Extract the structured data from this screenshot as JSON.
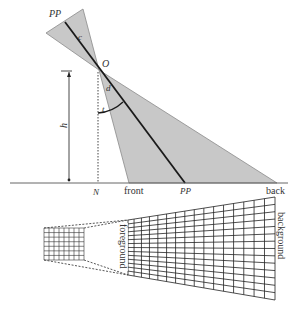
{
  "diagram": {
    "type": "camera viewing geometry / oblique photo footprint",
    "labels": {
      "pp_top": "PP",
      "c": "c",
      "o": "O",
      "d": "d",
      "t": "t",
      "h": "h",
      "n": "N",
      "front": "front",
      "pp_bottom": "PP",
      "back": "back",
      "foreground": "foreground",
      "background": "background"
    },
    "colors": {
      "cone_fill": "#c8c8c8",
      "cone_stroke": "#8a8a8a",
      "line": "#1a1a1a",
      "grid": "#222222",
      "dashed": "#444444"
    },
    "geometry": {
      "origin_O": [
        99,
        70
      ],
      "ground_y": 183,
      "N_x": 98,
      "front_x": 129,
      "pp_bottom_x": 185,
      "back_x": 277,
      "upper_cone": [
        [
          46,
          33
        ],
        [
          83,
          9
        ]
      ],
      "pp_top_point": [
        65,
        22
      ],
      "h_arrow_x": 69,
      "small_grid": {
        "x": 44,
        "y": 228,
        "w": 40,
        "h": 32,
        "cols": 8,
        "rows": 7
      },
      "large_grid": {
        "left_x": 128,
        "left_top": 220,
        "left_bottom": 275,
        "right_x": 275,
        "right_top": 197,
        "right_bottom": 300,
        "cols": 16,
        "rows": 14
      }
    }
  }
}
